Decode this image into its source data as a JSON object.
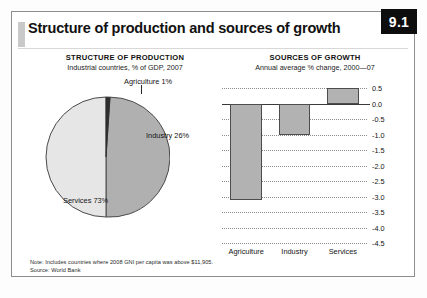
{
  "figure": {
    "number": "9.1",
    "title": "Structure of production and sources of growth"
  },
  "pie_panel": {
    "title": "STRUCTURE OF PRODUCTION",
    "subtitle": "Industrial countries, % of GDP, 2007",
    "labels": {
      "agriculture": "Agriculture 1%",
      "industry": "Industry 26%",
      "services": "Services 73%"
    }
  },
  "bar_panel": {
    "title": "SOURCES OF GROWTH",
    "subtitle": "Annual average % change, 2000—07"
  },
  "footnote": {
    "note": "Note: Includes countries where 2008 GNI per capita was above $11,905.",
    "source": "Source: World Bank"
  },
  "chart_data": [
    {
      "type": "pie",
      "title": "STRUCTURE OF PRODUCTION",
      "subtitle": "Industrial countries, % of GDP, 2007",
      "categories": [
        "Agriculture",
        "Industry",
        "Services"
      ],
      "values": [
        1,
        26,
        73
      ],
      "value_labels": [
        "Agriculture 1%",
        "Industry 26%",
        "Services 73%"
      ],
      "colors": [
        "#3a3a3a",
        "#e2e2e2",
        "#b0b0b0"
      ],
      "legend": "none",
      "start_angle_deg": 0,
      "direction": "clockwise"
    },
    {
      "type": "bar",
      "title": "SOURCES OF GROWTH",
      "subtitle": "Annual average % change, 2000—07",
      "categories": [
        "Agriculture",
        "Industry",
        "Services"
      ],
      "values": [
        -3.1,
        -1.0,
        0.5
      ],
      "xlabel": "",
      "ylabel": "",
      "ylim": [
        -4.5,
        0.5
      ],
      "yticks": [
        0.5,
        0.0,
        -0.5,
        -1.0,
        -1.5,
        -2.0,
        -2.5,
        -3.0,
        -3.5,
        -4.0,
        -4.5
      ],
      "ytick_labels": [
        "0.5",
        "0.0",
        "-0.5",
        "-1.0",
        "-1.5",
        "-2.0",
        "-2.5",
        "-3.0",
        "-3.5",
        "-4.0",
        "-4.5"
      ],
      "ytick_side": "right",
      "grid": true,
      "grid_style": "dotted",
      "legend": "none",
      "bar_color": "#b2b2b2",
      "bar_edge_color": "#4d4d4d"
    }
  ],
  "colors": {
    "badge_bg": "#0d0d0d",
    "badge_text": "#ffffff",
    "frame_border": "#8d8d8d",
    "accent_block": "#c9c9c9"
  }
}
